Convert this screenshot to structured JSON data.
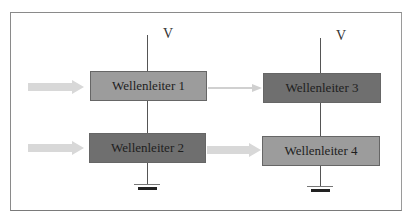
{
  "diagram": {
    "type": "waveguide-circuit",
    "frame": {
      "border_color": "#8a8a8a"
    },
    "voltage_labels": [
      "V",
      "V"
    ],
    "waveguides": [
      {
        "id": 1,
        "label": "Wellenleiter 1",
        "shade": "light",
        "color": "#9c9c9c"
      },
      {
        "id": 2,
        "label": "Wellenleiter 2",
        "shade": "dark",
        "color": "#6f6f6f"
      },
      {
        "id": 3,
        "label": "Wellenleiter 3",
        "shade": "dark",
        "color": "#6f6f6f"
      },
      {
        "id": 4,
        "label": "Wellenleiter 4",
        "shade": "light",
        "color": "#9c9c9c"
      }
    ],
    "arrows": [
      {
        "from": "input",
        "to": "Wellenleiter 1",
        "style": "thick-light"
      },
      {
        "from": "input",
        "to": "Wellenleiter 2",
        "style": "thick-light"
      },
      {
        "from": "Wellenleiter 1",
        "to": "Wellenleiter 3",
        "style": "thin-light"
      },
      {
        "from": "Wellenleiter 2",
        "to": "Wellenleiter 4",
        "style": "thick-light"
      }
    ],
    "grounds": [
      "left-ground",
      "right-ground"
    ],
    "colors": {
      "arrow": "#d6d6d6",
      "line": "#555555",
      "ground_bar": "#222222"
    }
  }
}
